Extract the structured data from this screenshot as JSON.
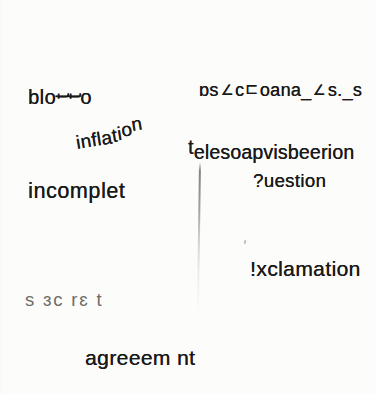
{
  "canvas": {
    "width": 376,
    "height": 394,
    "background": "#fcfcfa",
    "ink": "#1a1a1a"
  },
  "words": [
    {
      "id": "blotto",
      "left": 28,
      "top": 87,
      "size": 20,
      "ls": 0.5,
      "segs": [
        {
          "t": "blo"
        },
        {
          "t": "t",
          "rot": -90,
          "mx": 3,
          "dy": -1
        },
        {
          "t": "t",
          "rot": -90,
          "mx": 3,
          "dy": -1
        },
        {
          "t": "o"
        }
      ]
    },
    {
      "id": "scrambled-code",
      "left": 199,
      "top": 81,
      "size": 18,
      "ls": 0.3,
      "segs": [
        {
          "t": "ɒ"
        },
        {
          "t": "s"
        },
        {
          "t": "∠",
          "scale": 0.8
        },
        {
          "t": "c"
        },
        {
          "t": "⊏",
          "scale": 0.85,
          "dy": -1
        },
        {
          "t": "oana"
        },
        {
          "t": "_"
        },
        {
          "t": "∠",
          "scale": 0.8
        },
        {
          "t": "s"
        },
        {
          "t": "."
        },
        {
          "t": "_"
        },
        {
          "t": "s"
        }
      ]
    },
    {
      "id": "inflation",
      "left": 76,
      "top": 133,
      "size": 19,
      "rot": -9,
      "ls": 0.3,
      "segs": [
        {
          "t": "infla"
        },
        {
          "t": "t",
          "dy": -1
        },
        {
          "t": "i",
          "dy": -2
        },
        {
          "t": "o",
          "dy": -5
        },
        {
          "t": "n",
          "dy": -9
        }
      ]
    },
    {
      "id": "television-scramble",
      "left": 188,
      "top": 143,
      "size": 19.5,
      "ls": 0.2,
      "segs": [
        {
          "t": "t",
          "dy": -5
        },
        {
          "t": "elesoapvisbeerion"
        }
      ]
    },
    {
      "id": "incomplete",
      "left": 28,
      "top": 181,
      "size": 21.5,
      "ls": 0.6,
      "segs": [
        {
          "t": "incomplet"
        }
      ]
    },
    {
      "id": "question",
      "left": 253,
      "top": 172,
      "size": 18.5,
      "ls": 0.4,
      "segs": [
        {
          "t": "?uestion"
        }
      ]
    },
    {
      "id": "exclamation",
      "left": 250,
      "top": 258,
      "size": 21,
      "ls": 0.4,
      "segs": [
        {
          "t": "!xclamation"
        }
      ]
    },
    {
      "id": "secret",
      "left": 25,
      "top": 291,
      "size": 18.5,
      "ls": 1.8,
      "thin": true,
      "segs": [
        {
          "t": "s ɜc rɛ t"
        }
      ]
    },
    {
      "id": "agreement",
      "left": 85,
      "top": 347,
      "size": 21,
      "ls": 0.4,
      "segs": [
        {
          "t": "agreeem nt"
        }
      ]
    }
  ],
  "fold_line": {
    "left": 199,
    "top": 162,
    "height": 150
  },
  "speck": {
    "left": 244,
    "top": 240
  }
}
